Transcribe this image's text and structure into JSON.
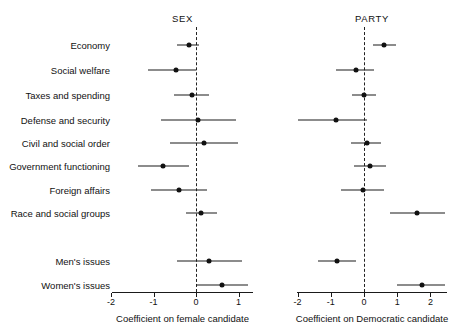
{
  "figure": {
    "width": 453,
    "height": 335,
    "background": "#ffffff",
    "foreground": "#111111"
  },
  "chart_data": {
    "type": "scatter",
    "subtype": "coefficient-plot-with-error-bars",
    "title": "",
    "panels": [
      {
        "name": "sex-panel",
        "title": "SEX",
        "xlabel": "Coefficient on female candidate",
        "xlim": [
          -2.2,
          1.3
        ],
        "xticks": [
          -2,
          -1,
          0,
          1
        ],
        "xticklabels": [
          "-2",
          "-1",
          "0",
          "1"
        ],
        "reference_line": 0,
        "grid": false,
        "categories": [
          "Economy",
          "Social welfare",
          "Taxes and spending",
          "Defense and security",
          "Civil and social order",
          "Government functioning",
          "Foreign affairs",
          "Race and social groups",
          "Men's issues",
          "Women's issues"
        ],
        "points": [
          {
            "label": "Economy",
            "estimate": -0.17,
            "ci_low": -0.44,
            "ci_high": 0.07
          },
          {
            "label": "Social welfare",
            "estimate": -0.46,
            "ci_low": -1.12,
            "ci_high": 0.0
          },
          {
            "label": "Taxes and spending",
            "estimate": -0.09,
            "ci_low": -0.51,
            "ci_high": 0.31
          },
          {
            "label": "Defense and security",
            "estimate": 0.05,
            "ci_low": -0.83,
            "ci_high": 0.95
          },
          {
            "label": "Civil and social order",
            "estimate": 0.18,
            "ci_low": -0.62,
            "ci_high": 0.98
          },
          {
            "label": "Government functioning",
            "estimate": -0.77,
            "ci_low": -1.37,
            "ci_high": -0.16
          },
          {
            "label": "Foreign affairs",
            "estimate": -0.39,
            "ci_low": -1.05,
            "ci_high": 0.26
          },
          {
            "label": "Race and social groups",
            "estimate": 0.12,
            "ci_low": -0.23,
            "ci_high": 0.5
          },
          {
            "label": "Men's issues",
            "estimate": 0.3,
            "ci_low": -0.45,
            "ci_high": 1.08
          },
          {
            "label": "Women's issues",
            "estimate": 0.6,
            "ci_low": 0.0,
            "ci_high": 1.23
          }
        ]
      },
      {
        "name": "party-panel",
        "title": "PARTY",
        "xlabel": "Coefficient on Democratic candidate",
        "xlim": [
          -2.2,
          2.5
        ],
        "xticks": [
          -2,
          -1,
          0,
          1,
          2
        ],
        "xticklabels": [
          "-2",
          "-1",
          "0",
          "1",
          "2"
        ],
        "reference_line": 0,
        "grid": false,
        "categories": [
          "Economy",
          "Social welfare",
          "Taxes and spending",
          "Defense and security",
          "Civil and social order",
          "Government functioning",
          "Foreign affairs",
          "Race and social groups",
          "Men's issues",
          "Women's issues"
        ],
        "points": [
          {
            "label": "Economy",
            "estimate": 0.6,
            "ci_low": 0.27,
            "ci_high": 0.95
          },
          {
            "label": "Social welfare",
            "estimate": -0.25,
            "ci_low": -0.85,
            "ci_high": 0.3
          },
          {
            "label": "Taxes and spending",
            "estimate": 0.0,
            "ci_low": -0.37,
            "ci_high": 0.37
          },
          {
            "label": "Defense and security",
            "estimate": -0.85,
            "ci_low": -2.0,
            "ci_high": 0.08
          },
          {
            "label": "Civil and social order",
            "estimate": 0.1,
            "ci_low": -0.38,
            "ci_high": 0.52
          },
          {
            "label": "Government functioning",
            "estimate": 0.17,
            "ci_low": -0.3,
            "ci_high": 0.65
          },
          {
            "label": "Foreign affairs",
            "estimate": -0.03,
            "ci_low": -0.7,
            "ci_high": 0.6
          },
          {
            "label": "Race and social groups",
            "estimate": 1.6,
            "ci_low": 0.78,
            "ci_high": 2.45
          },
          {
            "label": "Men's issues",
            "estimate": -0.8,
            "ci_low": -1.4,
            "ci_high": -0.25
          },
          {
            "label": "Women's issues",
            "estimate": 1.75,
            "ci_low": 1.0,
            "ci_high": 2.45
          }
        ]
      }
    ]
  },
  "layout": {
    "row_y": [
      45,
      70,
      95,
      120,
      143,
      166,
      190,
      213,
      261,
      285
    ],
    "gap_after_index": 7,
    "axis_y": 292,
    "tick_label_y": 297,
    "axis_title_y": 313,
    "title_y": 13,
    "labels_right_edge": 110,
    "sex": {
      "left": 112,
      "right": 253,
      "zero_x": 196,
      "unit_px": 42.5
    },
    "party": {
      "left": 297,
      "right": 447,
      "zero_x": 364,
      "unit_px": 33.2
    }
  }
}
